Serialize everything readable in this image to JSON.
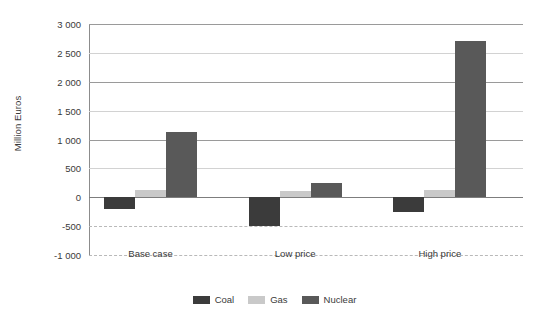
{
  "chart_data": {
    "type": "bar",
    "title": "",
    "xlabel": "",
    "ylabel": "Million Euros",
    "categories": [
      "Base case",
      "Low price",
      "High price"
    ],
    "series": [
      {
        "name": "Coal",
        "color": "#3b3b3b",
        "values": [
          -200,
          -500,
          -250
        ]
      },
      {
        "name": "Gas",
        "color": "#c9c9c9",
        "values": [
          130,
          100,
          120
        ]
      },
      {
        "name": "Nuclear",
        "color": "#595959",
        "values": [
          1130,
          250,
          2700
        ]
      }
    ],
    "ylim": [
      -1000,
      3000
    ],
    "yticks": [
      3000,
      2500,
      2000,
      1500,
      1000,
      500,
      0,
      -500,
      -1000
    ],
    "ytick_labels": [
      "3 000",
      "2 500",
      "2 000",
      "1 500",
      "1 000",
      "500",
      "0",
      "-500",
      "-1 000"
    ],
    "grid": true,
    "legend_position": "bottom"
  },
  "legend": {
    "items": [
      {
        "label": "Coal"
      },
      {
        "label": "Gas"
      },
      {
        "label": "Nuclear"
      }
    ]
  }
}
